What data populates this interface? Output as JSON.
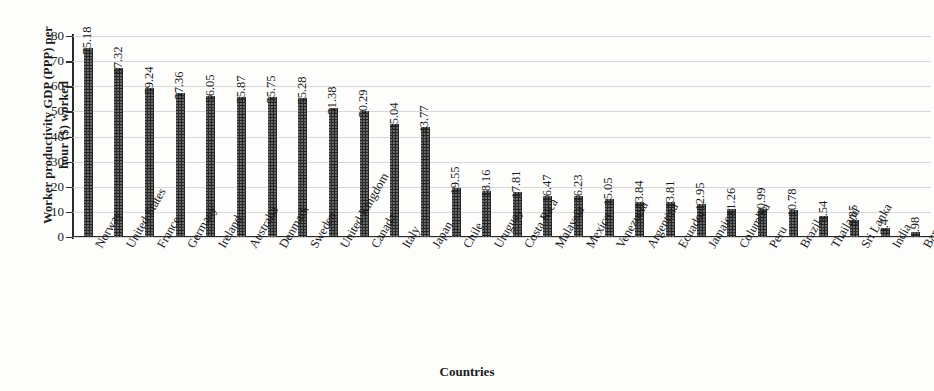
{
  "chart_data": {
    "type": "bar",
    "title": "",
    "xlabel": "Countries",
    "ylabel_line1": "Worker productivity GDP (PPP) per",
    "ylabel_line2": "hour ($) worked",
    "ylabel": "Worker productivity GDP (PPP) per hour ($) worked",
    "ylim": [
      0,
      80
    ],
    "ytick_labels": [
      "80",
      "70",
      "60",
      "50",
      "40",
      "30",
      "20",
      "10",
      "0"
    ],
    "yticks": [
      80,
      70,
      60,
      50,
      40,
      30,
      20,
      10,
      0
    ],
    "grid": true,
    "legend": "none",
    "bar_color": "#242424",
    "gridline_color": "#d8d8d8",
    "axis_color": "#2b2b2b",
    "categories": [
      "Norway",
      "United States",
      "France",
      "Germany",
      "Ireland",
      "Australia",
      "Denmark",
      "Sweden",
      "United Kingdom",
      "Canada",
      "Italy",
      "Japan",
      "Chile",
      "Uruguay",
      "Costa Rica",
      "Malaysia",
      "Mexico",
      "Venezuela",
      "Argentina",
      "Ecuador",
      "Jamaica",
      "Columbia",
      "Peru",
      "Brazil",
      "Thailand",
      "Sri Lanka",
      "India",
      "Bangladesh"
    ],
    "values": [
      75.18,
      67.32,
      59.24,
      57.36,
      56.05,
      55.87,
      55.75,
      55.28,
      51.38,
      50.29,
      45.04,
      43.77,
      19.55,
      18.16,
      17.81,
      16.47,
      16.23,
      15.05,
      13.84,
      13.81,
      12.95,
      11.26,
      10.99,
      10.78,
      8.54,
      6.85,
      3.4,
      1.98
    ],
    "value_labels": [
      "75.18",
      "67.32",
      "59.24",
      "57.36",
      "56.05",
      "55.87",
      "55.75",
      "55.28",
      "51.38",
      "50.29",
      "45.04",
      "43.77",
      "19.55",
      "18.16",
      "17.81",
      "16.47",
      "16.23",
      "15.05",
      "13.84",
      "13.81",
      "12.95",
      "11.26",
      "10.99",
      "10.78",
      "8.54",
      "6.85",
      "3.4",
      "1.98"
    ]
  }
}
